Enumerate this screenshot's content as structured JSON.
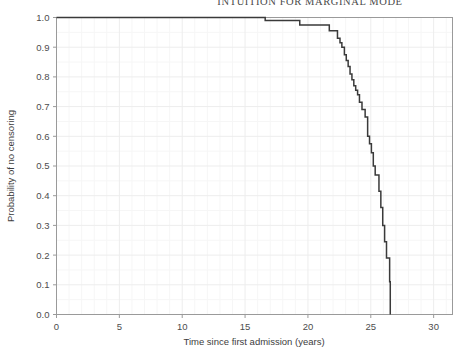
{
  "running_head": {
    "text": "INTUITION FOR MARGINAL MODE"
  },
  "colors": {
    "curve": "#3a3a3a",
    "frame": "#9a9a9a",
    "grid_major": "#ededed",
    "grid_minor": "#f6f6f6",
    "tick_text": "#4d4d4d",
    "background": "#ffffff"
  },
  "chart_data": {
    "type": "line",
    "title": "",
    "subtitle": "",
    "xlabel": "Time since first admission (years)",
    "ylabel": "Probability of no censoring",
    "xlim": [
      0,
      31.5
    ],
    "ylim": [
      0,
      1.0
    ],
    "grid": true,
    "legend": "none",
    "xticks": [
      0,
      5,
      10,
      15,
      20,
      25,
      30
    ],
    "xtick_labels": [
      "0",
      "5",
      "10",
      "15",
      "20",
      "25",
      "30"
    ],
    "yticks": [
      0.0,
      0.1,
      0.2,
      0.3,
      0.4,
      0.5,
      0.6,
      0.7,
      0.8,
      0.9,
      1.0
    ],
    "ytick_labels": [
      "0.0",
      "0.1",
      "0.2",
      "0.3",
      "0.4",
      "0.5",
      "0.6",
      "0.7",
      "0.8",
      "0.9",
      "1.0"
    ],
    "step_style": "post",
    "series": [
      {
        "name": "Probability of no censoring",
        "x": [
          0.0,
          10.35,
          16.6,
          19.35,
          21.7,
          22.1,
          22.35,
          22.55,
          22.7,
          22.9,
          23.05,
          23.2,
          23.35,
          23.5,
          23.65,
          23.8,
          23.95,
          24.1,
          24.3,
          24.55,
          24.75,
          24.9,
          25.05,
          25.2,
          25.35,
          25.5,
          25.65,
          25.8,
          25.95,
          26.1,
          26.25,
          26.4,
          26.5,
          26.55
        ],
        "y": [
          1.0,
          1.0,
          0.99,
          0.975,
          0.955,
          0.955,
          0.93,
          0.915,
          0.9,
          0.875,
          0.855,
          0.835,
          0.81,
          0.79,
          0.77,
          0.755,
          0.74,
          0.715,
          0.69,
          0.665,
          0.6,
          0.575,
          0.545,
          0.5,
          0.47,
          0.47,
          0.415,
          0.36,
          0.3,
          0.245,
          0.19,
          0.19,
          0.11,
          0.0
        ]
      }
    ]
  }
}
